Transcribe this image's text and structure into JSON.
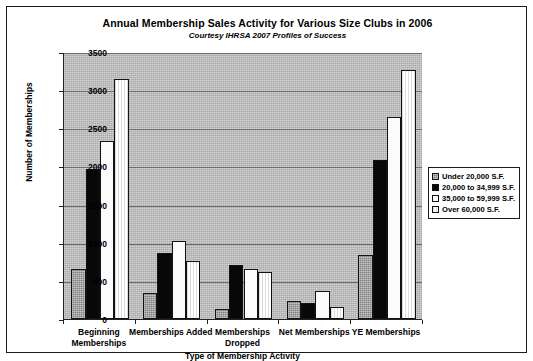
{
  "chart_data": {
    "type": "bar",
    "title": "Annual Membership Sales Activity for Various Size Clubs in 2006",
    "subtitle": "Courtesy IHRSA 2007 Profiles of Success",
    "xlabel": "Type of Membership Activity",
    "ylabel": "Number of Memberships",
    "ylim": [
      0,
      3500
    ],
    "ytick_step": 500,
    "yticks": [
      "3500",
      "3000",
      "2500",
      "2000",
      "1500",
      "1000",
      "500",
      "0"
    ],
    "grid": true,
    "legend_position": "right",
    "categories": [
      "Beginning Memberships",
      "Memberships Added",
      "Memberships Dropped",
      "Net Memberships",
      "YE Memberships"
    ],
    "series": [
      {
        "name": "Under 20,000 S.F.",
        "values": [
          650,
          340,
          130,
          230,
          840
        ]
      },
      {
        "name": "20,000 to 34,999 S.F.",
        "values": [
          1970,
          870,
          710,
          210,
          2090
        ]
      },
      {
        "name": "35,000 to 59,999 S.F.",
        "values": [
          2340,
          1020,
          650,
          370,
          2650
        ]
      },
      {
        "name": "Over 60,000 S.F.",
        "values": [
          3150,
          755,
          620,
          155,
          3270
        ]
      }
    ],
    "colors": {
      "series_0": "#7f7f7f",
      "series_1": "#080808",
      "series_2": "#fbfbfb",
      "series_3": "#ffffff",
      "plot_background": "#a8a8a8",
      "axis": "#1a1a1a",
      "gridline": "#6d6d6d"
    }
  }
}
